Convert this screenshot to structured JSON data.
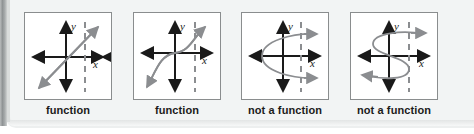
{
  "figure": {
    "kind": "vertical-line-test-examples",
    "panel_count": 4,
    "colors": {
      "page_background": "#edefef",
      "panel_background": "#ffffff",
      "panel_border": "#8a8d8e",
      "axis": "#1a1a1a",
      "curve": "#8b8d90",
      "dashed_test_line": "#8b8d90",
      "caption_text": "#1b1b1b"
    },
    "panels": [
      {
        "id": "panel-1",
        "graph_type": "line",
        "description": "straight diagonal line with arrowheads at both ends passing through the origin",
        "axis_labels": {
          "x": "x",
          "y": "y"
        },
        "has_dashed_vertical_line": true,
        "caption": "function"
      },
      {
        "id": "panel-2",
        "graph_type": "cubic",
        "description": "cubic S-shaped curve increasing left to right with arrowheads at both ends",
        "axis_labels": {
          "x": "x",
          "y": "y"
        },
        "has_dashed_vertical_line": true,
        "caption": "function"
      },
      {
        "id": "panel-3",
        "graph_type": "sideways-parabola",
        "description": "parabola opening to the right, crossing the dashed vertical line twice",
        "axis_labels": {
          "x": "x",
          "y": "y"
        },
        "has_dashed_vertical_line": true,
        "caption": "not a function"
      },
      {
        "id": "panel-4",
        "graph_type": "sideways-cubic",
        "description": "sideways S-shaped cubic crossing the dashed vertical line three times",
        "axis_labels": {
          "x": "x",
          "y": "y"
        },
        "has_dashed_vertical_line": true,
        "caption": "not a function"
      }
    ]
  }
}
